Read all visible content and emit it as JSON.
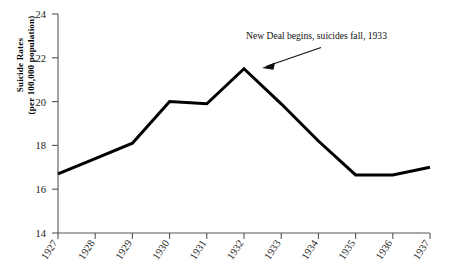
{
  "chart_data": {
    "type": "line",
    "title": "",
    "subtitle": "",
    "xlabel": "",
    "ylabel": "Suicide Rates (per 100,000 population)",
    "ylabel_lines": [
      "Suicide Rates",
      "(per 100,000 population)"
    ],
    "categories": [
      "1927",
      "1928",
      "1929",
      "1930",
      "1931",
      "1932",
      "1933",
      "1934",
      "1935",
      "1936",
      "1937"
    ],
    "values": [
      16.7,
      17.4,
      18.1,
      20.0,
      19.9,
      21.5,
      19.9,
      18.2,
      16.65,
      16.65,
      17.0
    ],
    "series": [
      {
        "name": "Suicide Rates",
        "values": [
          16.7,
          17.4,
          18.1,
          20.0,
          19.9,
          21.5,
          19.9,
          18.2,
          16.65,
          16.65,
          17.0
        ],
        "color": "#000000"
      }
    ],
    "ylim": [
      14,
      24
    ],
    "ytick_labels": [
      "14",
      "16",
      "18",
      "20",
      "22",
      "24"
    ],
    "ytick_values": [
      14,
      16,
      18,
      20,
      22,
      24
    ],
    "xlim": [
      "1927",
      "1937"
    ],
    "grid": false,
    "legend": false,
    "legend_position": "none",
    "line_color": "#000000",
    "line_width": 3,
    "axis_color": "#555555",
    "background": "#ffffff",
    "annotations": [
      {
        "text": "New Deal begins, suicides fall, 1933",
        "points_to_year": "1932",
        "arrow": true
      }
    ]
  },
  "axes": {
    "y_label_line1": "Suicide Rates",
    "y_label_line2": "(per 100,000 population)",
    "y_ticks": [
      "24",
      "22",
      "20",
      "18",
      "16",
      "14"
    ],
    "x_ticks": [
      "1927",
      "1928",
      "1929",
      "1930",
      "1931",
      "1932",
      "1933",
      "1934",
      "1935",
      "1936",
      "1937"
    ]
  },
  "annotation": {
    "label": "New Deal begins, suicides fall, 1933"
  }
}
